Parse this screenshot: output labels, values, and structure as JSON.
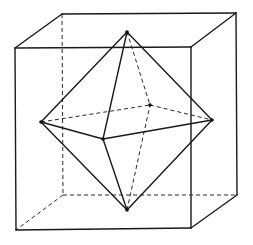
{
  "figure": {
    "line_color": "#1a1a1a",
    "background": "#ffffff",
    "cube": {
      "vertices": [
        "front-top-left",
        "front-top-right",
        "front-bottom-right",
        "front-bottom-left",
        "back-top-left",
        "back-top-right",
        "back-bottom-right",
        "back-bottom-left"
      ],
      "visible_edges": [
        [
          "front-top-left",
          "front-top-right"
        ],
        [
          "front-top-right",
          "front-bottom-right"
        ],
        [
          "front-bottom-right",
          "front-bottom-left"
        ],
        [
          "front-bottom-left",
          "front-top-left"
        ],
        [
          "front-top-left",
          "back-top-left"
        ],
        [
          "back-top-left",
          "back-top-right"
        ],
        [
          "front-top-right",
          "back-top-right"
        ],
        [
          "back-top-right",
          "back-bottom-right"
        ],
        [
          "front-bottom-right",
          "back-bottom-right"
        ]
      ],
      "hidden_edges": [
        [
          "back-top-left",
          "back-bottom-left"
        ],
        [
          "back-bottom-left",
          "back-bottom-right"
        ],
        [
          "back-bottom-left",
          "front-bottom-left"
        ]
      ]
    },
    "octahedron": {
      "vertices": [
        "top",
        "bottom",
        "left",
        "right",
        "front",
        "back"
      ],
      "visible_edges": [
        [
          "top",
          "left"
        ],
        [
          "top",
          "right"
        ],
        [
          "top",
          "front"
        ],
        [
          "bottom",
          "left"
        ],
        [
          "bottom",
          "right"
        ],
        [
          "bottom",
          "front"
        ],
        [
          "left",
          "front"
        ],
        [
          "front",
          "right"
        ]
      ],
      "hidden_edges": [
        [
          "top",
          "back"
        ],
        [
          "bottom",
          "back"
        ],
        [
          "left",
          "back"
        ],
        [
          "back",
          "right"
        ]
      ]
    }
  }
}
